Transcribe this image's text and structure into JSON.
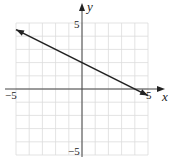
{
  "chart_data": {
    "type": "line",
    "title": "",
    "xlabel": "x",
    "ylabel": "y",
    "xlim": [
      -5,
      5
    ],
    "ylim": [
      -5,
      5
    ],
    "grid": true,
    "tick_labels": {
      "x": [
        "-5",
        "5"
      ],
      "y": [
        "5",
        "-5"
      ]
    },
    "series": [
      {
        "name": "line",
        "equation": "y = -0.5x + 2",
        "x": [
          -5,
          5
        ],
        "y": [
          4.5,
          -0.5
        ],
        "arrows": "both",
        "color": "#222222"
      }
    ]
  },
  "labels": {
    "x_axis": "x",
    "y_axis": "y",
    "x_min": "−5",
    "x_max": "5",
    "y_max": "5",
    "y_min": "−5"
  },
  "colors": {
    "grid": "#dcdcdc",
    "axis": "#444444",
    "line": "#222222"
  }
}
